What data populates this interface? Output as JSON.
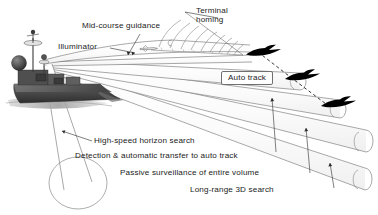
{
  "diagram": {
    "background_color": "#ffffff",
    "line_color": "#6f6f6f",
    "text_color": "#1a1a1a",
    "target_color": "#000000"
  },
  "labels": {
    "mid_course_guidance": "Mid-course guidance",
    "terminal_homing": "Terminal\nhoming",
    "illuminator": "Illuminator",
    "auto_track": "Auto track",
    "high_speed_horizon_search": "High-speed horizon search",
    "detection_auto_transfer": "Detection & automatic transfer to auto track",
    "passive_surveillance": "Passive surveillance of entire volume",
    "long_range_3d_search": "Long-range 3D search"
  },
  "objects": {
    "ship": "naval-ship",
    "radar_dome": "radar-dome",
    "mast_antenna": "mast-antenna",
    "aircraft_count": 3,
    "missile": "missile-in-midcourse-beam",
    "wavefront_arcs": 9,
    "beam_origin": {
      "x": 44,
      "y": 63
    }
  }
}
